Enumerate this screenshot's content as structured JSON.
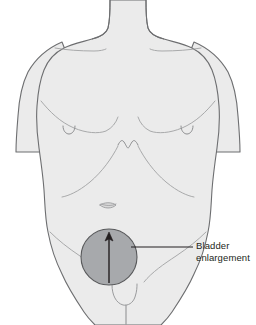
{
  "figure": {
    "type": "anatomical-illustration",
    "background_color": "#ffffff"
  },
  "body": {
    "fill_color": "#ebebeb",
    "outline_color": "#58595b",
    "detail_line_color": "#9a9b9d",
    "parts": [
      "neck",
      "shoulders",
      "left-arm",
      "right-arm",
      "chest",
      "abdomen",
      "pelvis",
      "genitals",
      "legs"
    ]
  },
  "highlight": {
    "name": "bladder-region",
    "shape": "circle",
    "fill_color": "#a7a9ac",
    "stroke_color": "#58595b",
    "center_x": 109,
    "center_y": 257,
    "radius": 28
  },
  "arrow": {
    "name": "enlargement-direction-arrow",
    "direction": "up",
    "color": "#231f20",
    "x": 109,
    "y_start": 283,
    "y_end": 233
  },
  "callout": {
    "label": "Bladder\nenlargement",
    "line_1": "Bladder",
    "line_2": "enlargement",
    "leader_line": {
      "color": "#231f20",
      "x_start": 131,
      "x_end": 193,
      "y": 247
    },
    "text_color": "#231f20"
  }
}
